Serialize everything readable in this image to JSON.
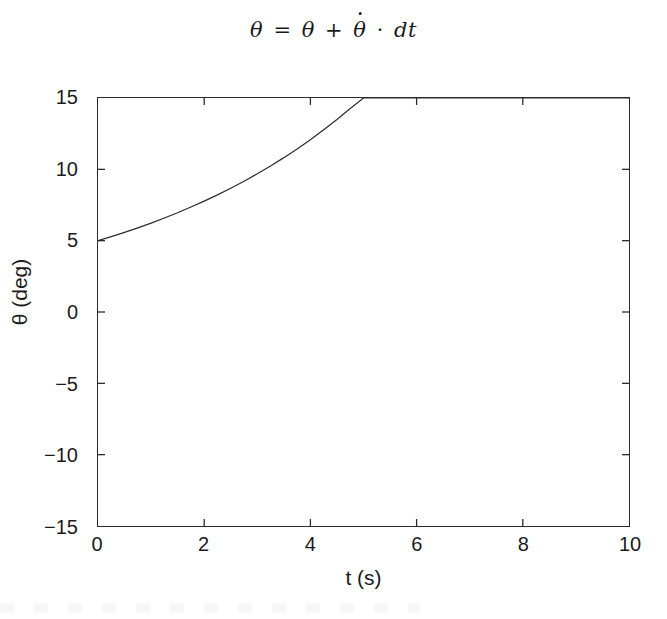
{
  "figure": {
    "background_color": "#ffffff",
    "line_color": "#2b2b2b",
    "axis_color": "#2b2b2b"
  },
  "title": {
    "lhs": "θ",
    "equals": "=",
    "rhs_first": "θ",
    "plus": "+",
    "rhs_dot_symbol": "θ",
    "cdot": "·",
    "differential": "dt",
    "plain_text": "θ = θ + θ̇ · dt"
  },
  "axes": {
    "xlabel": "t (s)",
    "ylabel": "θ (deg)",
    "xticks": [
      "0",
      "2",
      "4",
      "6",
      "8",
      "10"
    ],
    "yticks": [
      "15",
      "10",
      "5",
      "0",
      "−5",
      "−10",
      "−15"
    ]
  },
  "chart_data": {
    "type": "line",
    "xlabel": "t (s)",
    "ylabel": "θ (deg)",
    "xlim": [
      0,
      10
    ],
    "ylim": [
      -15,
      15
    ],
    "xticks": [
      0,
      2,
      4,
      6,
      8,
      10
    ],
    "yticks": [
      -15,
      -10,
      -5,
      0,
      5,
      10,
      15
    ],
    "grid": false,
    "legend": null,
    "tick_direction": "in",
    "box": true,
    "series": [
      {
        "name": "theta",
        "color": "#2b2b2b",
        "linewidth": 1.2,
        "note": "exponential growth from 5 deg, clipped at axis top (15 deg) near t = 5 s",
        "x": [
          0.0,
          0.25,
          0.5,
          0.75,
          1.0,
          1.25,
          1.5,
          1.75,
          2.0,
          2.25,
          2.5,
          2.75,
          3.0,
          3.25,
          3.5,
          3.75,
          4.0,
          4.25,
          4.5,
          4.75,
          5.0,
          5.25,
          5.5,
          6.0,
          7.0,
          8.0,
          9.0,
          10.0
        ],
        "y": [
          5.0,
          5.28,
          5.58,
          5.9,
          6.23,
          6.59,
          6.96,
          7.36,
          7.77,
          8.21,
          8.68,
          9.17,
          9.69,
          10.24,
          10.82,
          11.43,
          12.08,
          12.77,
          13.49,
          14.26,
          15.0,
          15.0,
          15.0,
          15.0,
          15.0,
          15.0,
          15.0,
          15.0
        ]
      }
    ]
  }
}
